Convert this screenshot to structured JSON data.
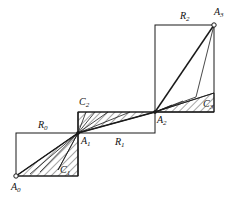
{
  "figure": {
    "type": "geometric-diagram",
    "width": 235,
    "height": 202,
    "background_color": "#ffffff",
    "stroke_color": "#1a1a1a",
    "hatch_color": "#3a3a3a"
  },
  "points": [
    {
      "id": "A0",
      "label": "A",
      "sub": "0",
      "x": 16,
      "y": 176,
      "marker": "open-circle",
      "label_x": 11,
      "label_y": 182
    },
    {
      "id": "A1",
      "label": "A",
      "sub": "1",
      "x": 78,
      "y": 133,
      "marker": "dot",
      "label_x": 81,
      "label_y": 136
    },
    {
      "id": "A2",
      "label": "A",
      "sub": "2",
      "x": 155,
      "y": 112,
      "marker": "dot",
      "label_x": 157,
      "label_y": 115
    },
    {
      "id": "A3",
      "label": "A",
      "sub": "3",
      "x": 214,
      "y": 25,
      "marker": "open-circle",
      "label_x": 214,
      "label_y": 7
    }
  ],
  "rectangles": [
    {
      "id": "R0",
      "label": "R",
      "sub": "0",
      "x0": 16,
      "y0": 133,
      "x1": 78,
      "y1": 176,
      "label_x": 38,
      "label_y": 120
    },
    {
      "id": "R1",
      "label": "R",
      "sub": "1",
      "x0": 78,
      "y0": 112,
      "x1": 155,
      "y1": 133,
      "label_x": 115,
      "label_y": 137
    },
    {
      "id": "R2",
      "label": "R",
      "sub": "2",
      "x0": 155,
      "y0": 25,
      "x1": 214,
      "y1": 112,
      "label_x": 180,
      "label_y": 11
    }
  ],
  "hatched_regions": [
    {
      "id": "C1",
      "label": "C",
      "sub": "1",
      "vertices": [
        [
          16,
          176
        ],
        [
          78,
          176
        ],
        [
          78,
          133
        ]
      ],
      "label_x": 60,
      "label_y": 165
    },
    {
      "id": "C2",
      "label": "C",
      "sub": "2",
      "vertices": [
        [
          78,
          133
        ],
        [
          78,
          112
        ],
        [
          155,
          112
        ]
      ],
      "label_x": 79,
      "label_y": 97
    },
    {
      "id": "C3",
      "label": "C",
      "sub": "3",
      "vertices": [
        [
          155,
          112
        ],
        [
          214,
          112
        ],
        [
          214,
          93
        ]
      ],
      "label_x": 203,
      "label_y": 99
    }
  ],
  "fan_lines": [
    {
      "from": "A1",
      "to_x": 16,
      "to_y": 176,
      "weight": "bold"
    },
    {
      "from": "A1",
      "to_x": 78,
      "to_y": 176,
      "weight": "normal"
    },
    {
      "from": "A1",
      "to_x": 58,
      "to_y": 170,
      "weight": "normal"
    },
    {
      "from": "A1",
      "to_x": 40,
      "to_y": 172,
      "weight": "normal"
    },
    {
      "from": "A1",
      "to_x": 30,
      "to_y": 174,
      "weight": "normal"
    },
    {
      "from": "A1",
      "to_x": 155,
      "to_y": 112,
      "weight": "bold"
    },
    {
      "from": "A1",
      "to_x": 130,
      "to_y": 112,
      "weight": "normal"
    },
    {
      "from": "A1",
      "to_x": 108,
      "to_y": 112,
      "weight": "normal"
    },
    {
      "from": "A1",
      "to_x": 95,
      "to_y": 112,
      "weight": "normal"
    },
    {
      "from": "A1",
      "to_x": 86,
      "to_y": 112,
      "weight": "normal"
    },
    {
      "from": "A1",
      "to_x": 78,
      "to_y": 112,
      "weight": "normal"
    },
    {
      "from": "A2",
      "to_x": 214,
      "to_y": 25,
      "weight": "bold"
    },
    {
      "from": "A2",
      "to_x": 214,
      "to_y": 93,
      "weight": "normal"
    },
    {
      "from": "A2",
      "to_x": 214,
      "to_y": 112,
      "weight": "normal"
    },
    {
      "from": "A2",
      "to_x": 196,
      "to_y": 97,
      "weight": "normal"
    },
    {
      "from": "A2",
      "to_x": 183,
      "to_y": 101,
      "weight": "normal"
    },
    {
      "from": "A2",
      "to_x": 172,
      "to_y": 105,
      "weight": "normal"
    }
  ],
  "extra_segments": [
    {
      "id": "A3-to-C3-corner",
      "x0": 214,
      "y0": 25,
      "x1": 196,
      "y1": 97,
      "weight": "normal"
    },
    {
      "id": "A1-apex-left",
      "x0": 78,
      "y0": 133,
      "x1": 58,
      "y1": 170,
      "weight": "normal"
    }
  ]
}
